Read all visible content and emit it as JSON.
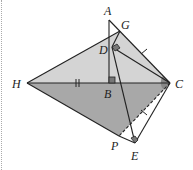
{
  "diagram": {
    "type": "geometry",
    "points": {
      "A": {
        "label": "A",
        "x": 109,
        "y": 20
      },
      "G": {
        "label": "G",
        "x": 120,
        "y": 31
      },
      "D": {
        "label": "D",
        "x": 112,
        "y": 47
      },
      "H": {
        "label": "H",
        "x": 27,
        "y": 83
      },
      "B": {
        "label": "B",
        "x": 109,
        "y": 83
      },
      "C": {
        "label": "C",
        "x": 170,
        "y": 83
      },
      "P": {
        "label": "P",
        "x": 119,
        "y": 136
      },
      "E": {
        "label": "E",
        "x": 135,
        "y": 143
      }
    },
    "labels": {
      "A": "A",
      "G": "G",
      "D": "D",
      "H": "H",
      "B": "B",
      "C": "C",
      "P": "P",
      "E": "E"
    },
    "shaded_regions": [
      "H-G-C (light)",
      "H-C-P (dark)"
    ],
    "marks": {
      "right_angles": [
        "B",
        "D",
        "E"
      ],
      "tick_single": [
        "GC",
        "CE"
      ],
      "tick_double": [
        "HB"
      ],
      "angle_arc": "C"
    },
    "colors": {
      "light_fill": "#d4d4d4",
      "dark_fill": "#a8a8a8",
      "stroke": "#222222"
    }
  }
}
